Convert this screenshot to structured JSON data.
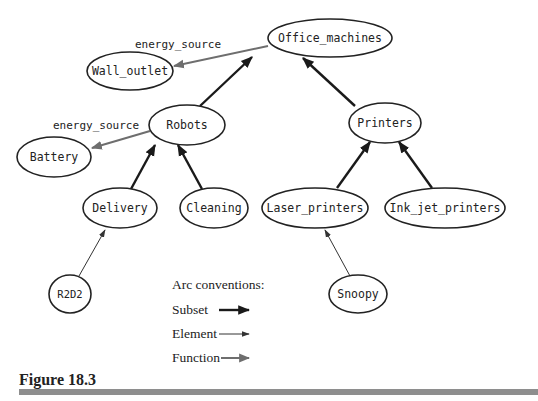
{
  "figure": {
    "caption": "Figure 18.3"
  },
  "nodes": {
    "office_machines": "Office_machines",
    "wall_outlet": "Wall_outlet",
    "robots": "Robots",
    "battery": "Battery",
    "printers": "Printers",
    "delivery": "Delivery",
    "cleaning": "Cleaning",
    "laser_printers": "Laser_printers",
    "ink_jet_printers": "Ink_jet_printers",
    "r2d2": "R2D2",
    "snoopy": "Snoopy"
  },
  "edges": [
    {
      "from": "Robots",
      "to": "Office_machines",
      "type": "Subset"
    },
    {
      "from": "Printers",
      "to": "Office_machines",
      "type": "Subset"
    },
    {
      "from": "Office_machines",
      "to": "Wall_outlet",
      "type": "Function",
      "label": "energy_source"
    },
    {
      "from": "Robots",
      "to": "Battery",
      "type": "Function",
      "label": "energy_source"
    },
    {
      "from": "Delivery",
      "to": "Robots",
      "type": "Subset"
    },
    {
      "from": "Cleaning",
      "to": "Robots",
      "type": "Subset"
    },
    {
      "from": "Laser_printers",
      "to": "Printers",
      "type": "Subset"
    },
    {
      "from": "Ink_jet_printers",
      "to": "Printers",
      "type": "Subset"
    },
    {
      "from": "R2D2",
      "to": "Delivery",
      "type": "Element"
    },
    {
      "from": "Snoopy",
      "to": "Laser_printers",
      "type": "Element"
    }
  ],
  "edge_labels": {
    "office_energy": "energy_source",
    "robots_energy": "energy_source"
  },
  "legend": {
    "title": "Arc conventions:",
    "items": [
      {
        "label": "Subset",
        "style": "thick-black"
      },
      {
        "label": "Element",
        "style": "thin-black"
      },
      {
        "label": "Function",
        "style": "medium-gray"
      }
    ]
  },
  "colors": {
    "subset": "#1a1a1a",
    "element": "#333333",
    "function": "#6e6e6e",
    "rule": "#8e8e8e"
  }
}
